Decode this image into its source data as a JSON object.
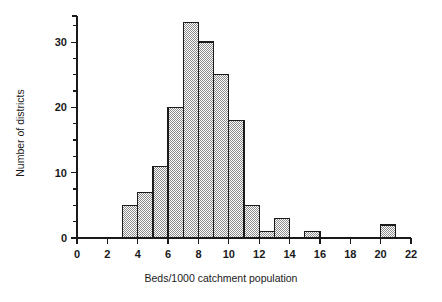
{
  "chart_data": {
    "type": "bar",
    "title": "",
    "subtitle": "",
    "xlabel": "Beds/1000 catchment population",
    "ylabel": "Number of districts",
    "xlim": [
      0,
      22
    ],
    "ylim": [
      0,
      34
    ],
    "grid": false,
    "legend": null,
    "bin_width": 1,
    "x_major_ticks": [
      0,
      2,
      4,
      6,
      8,
      10,
      12,
      14,
      16,
      18,
      20,
      22
    ],
    "x_tick_labels": [
      "0",
      "2",
      "4",
      "6",
      "8",
      "10",
      "12",
      "14",
      "16",
      "18",
      "20",
      "22"
    ],
    "y_major_ticks": [
      0,
      10,
      20,
      30
    ],
    "y_tick_labels": [
      "0",
      "10",
      "20",
      "30"
    ],
    "y_minor_tick_step": 2.5,
    "y_minor_ticks": [
      0,
      2.5,
      5,
      7.5,
      10,
      12.5,
      15,
      17.5,
      20,
      22.5,
      25,
      27.5,
      30,
      32.5
    ],
    "categories": [
      "3-4",
      "4-5",
      "5-6",
      "6-7",
      "7-8",
      "8-9",
      "9-10",
      "10-11",
      "11-12",
      "12-13",
      "13-14",
      "15-16",
      "20-21"
    ],
    "bins": [
      {
        "start": 3,
        "end": 4,
        "value": 5
      },
      {
        "start": 4,
        "end": 5,
        "value": 7
      },
      {
        "start": 5,
        "end": 6,
        "value": 11
      },
      {
        "start": 6,
        "end": 7,
        "value": 20
      },
      {
        "start": 7,
        "end": 8,
        "value": 33
      },
      {
        "start": 8,
        "end": 9,
        "value": 30
      },
      {
        "start": 9,
        "end": 10,
        "value": 25
      },
      {
        "start": 10,
        "end": 11,
        "value": 18
      },
      {
        "start": 11,
        "end": 12,
        "value": 5
      },
      {
        "start": 12,
        "end": 13,
        "value": 1
      },
      {
        "start": 13,
        "end": 14,
        "value": 3
      },
      {
        "start": 15,
        "end": 16,
        "value": 1
      },
      {
        "start": 20,
        "end": 21,
        "value": 2
      }
    ],
    "values": [
      5,
      7,
      11,
      20,
      33,
      30,
      25,
      18,
      5,
      1,
      3,
      1,
      2
    ],
    "colors": {
      "background": "#ffffff",
      "bar_fill": "#9e9e9e",
      "bar_edge": "#1a1a1a",
      "axis": "#1a1a1a",
      "text": "#1a1a1a"
    }
  }
}
